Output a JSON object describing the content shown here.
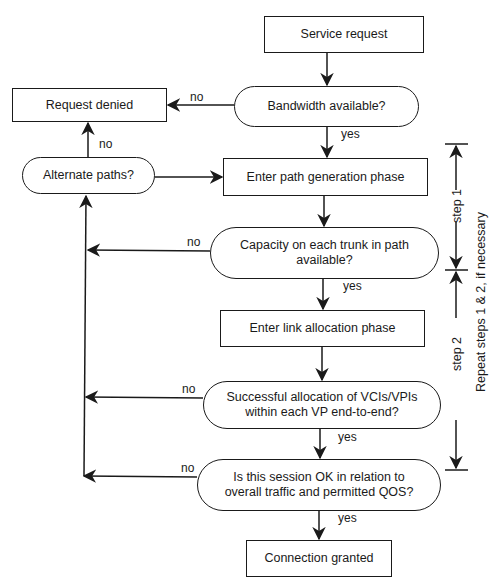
{
  "diagram": {
    "type": "flowchart",
    "nodes": {
      "service_request": "Service request",
      "bandwidth_available": "Bandwidth available?",
      "request_denied": "Request denied",
      "alternate_paths": "Alternate paths?",
      "path_generation": "Enter path generation phase",
      "capacity_check": "Capacity on each trunk in path available?",
      "link_allocation": "Enter link allocation phase",
      "allocation_check": "Successful allocation of VCIs/VPIs within each VP end-to-end?",
      "session_check": "Is this session OK in relation to overall traffic and permitted QOS?",
      "connection_granted": "Connection granted"
    },
    "edge_labels": {
      "bandwidth_no": "no",
      "bandwidth_yes": "yes",
      "alternate_no": "no",
      "capacity_no": "no",
      "capacity_yes": "yes",
      "allocation_no": "no",
      "allocation_yes": "yes",
      "session_no": "no",
      "session_yes": "yes"
    },
    "annotations": {
      "step1": "step 1",
      "step2": "step 2",
      "repeat": "Repeat steps 1 & 2, if necessary"
    }
  }
}
